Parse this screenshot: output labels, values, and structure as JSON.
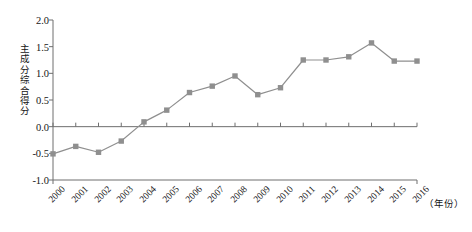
{
  "chart_data": {
    "type": "line",
    "title": "",
    "xlabel": "（年份）",
    "ylabel": "主成分综合得分",
    "ylim": [
      -1.0,
      2.0
    ],
    "yticks": [
      "2.0",
      "1.5",
      "1.0",
      "0.5",
      "0.0",
      "-0.5",
      "-1.0"
    ],
    "ytick_values": [
      2.0,
      1.5,
      1.0,
      0.5,
      0.0,
      -0.5,
      -1.0
    ],
    "grid": false,
    "legend": "none",
    "marker": "square",
    "series_color": "#8f8f8f",
    "zero_line_color": "#6e6e6e",
    "axis_color": "#6e6e6e",
    "categories": [
      "2000",
      "2001",
      "2002",
      "2003",
      "2004",
      "2005",
      "2006",
      "2007",
      "2008",
      "2009",
      "2010",
      "2011",
      "2012",
      "2013",
      "2014",
      "2015",
      "2016"
    ],
    "series": [
      {
        "name": "主成分综合得分",
        "values": [
          -0.51,
          -0.37,
          -0.48,
          -0.27,
          0.09,
          0.31,
          0.64,
          0.76,
          0.95,
          0.6,
          0.73,
          1.25,
          1.25,
          1.31,
          1.57,
          1.23,
          1.23
        ]
      }
    ]
  }
}
